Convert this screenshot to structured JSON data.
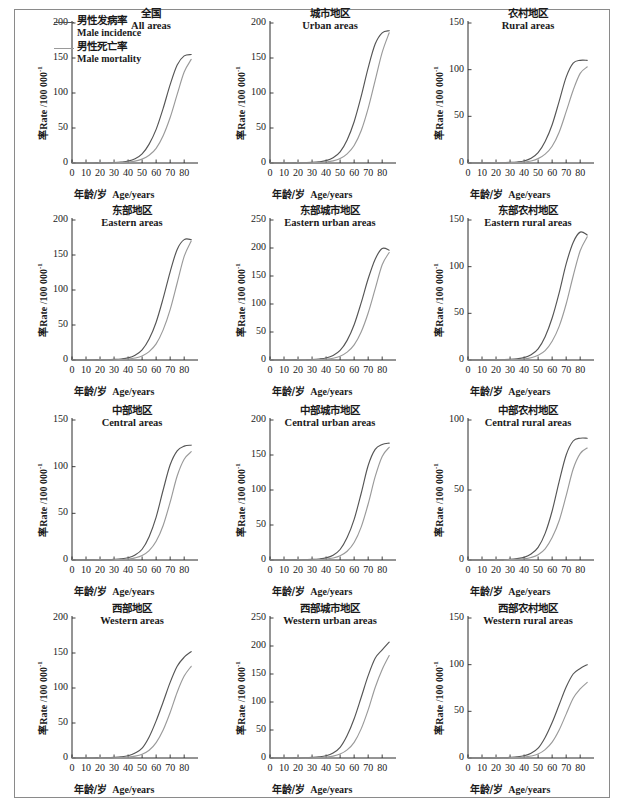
{
  "figure": {
    "axis_x_label_zh": "年龄/岁",
    "axis_x_label_en": "Age/years",
    "axis_y_label_zh": "率Rate /100 000",
    "axis_y_label_sup": "-1",
    "legend": [
      {
        "label_zh": "男性发病率",
        "label_en": "Male incidence",
        "color": "#555555"
      },
      {
        "label_zh": "男性死亡率",
        "label_en": "Male mortality",
        "color": "#9a9a9a"
      }
    ]
  },
  "chart_data": {
    "type": "line",
    "xlabel": "年龄/岁 Age/years",
    "ylabel": "率Rate /100 000-1",
    "xlim": [
      0,
      87
    ],
    "xticks": [
      0,
      10,
      20,
      30,
      40,
      50,
      60,
      70,
      80
    ],
    "x": [
      0,
      5,
      10,
      15,
      20,
      25,
      30,
      35,
      40,
      45,
      50,
      55,
      60,
      65,
      70,
      75,
      80,
      85
    ],
    "series_names": [
      "Male incidence",
      "Male mortality"
    ],
    "panels": [
      {
        "title_zh": "全国",
        "title_en": "All areas",
        "ylim": [
          0,
          200
        ],
        "yticks": [
          0,
          50,
          100,
          150,
          200
        ],
        "series": [
          {
            "name": "Male incidence",
            "color": "#555555",
            "values": [
              0,
              0,
              0,
              0,
              0.2,
              0.4,
              0.7,
              1.3,
              2.6,
              6.0,
              13.0,
              27.0,
              48.0,
              78.0,
              112.0,
              140.0,
              153.0,
              155.0
            ]
          },
          {
            "name": "Male mortality",
            "color": "#9a9a9a",
            "values": [
              0,
              0,
              0,
              0,
              0.1,
              0.2,
              0.3,
              0.6,
              1.2,
              2.6,
              5.5,
              11.0,
              21.0,
              39.0,
              65.0,
              98.0,
              130.0,
              148.0
            ]
          }
        ]
      },
      {
        "title_zh": "城市地区",
        "title_en": "Urban areas",
        "ylim": [
          0,
          200
        ],
        "yticks": [
          0,
          50,
          100,
          150,
          200
        ],
        "series": [
          {
            "name": "Male incidence",
            "color": "#555555",
            "values": [
              0,
              0,
              0,
              0,
              0.2,
              0.5,
              0.9,
              1.7,
              3.4,
              7.5,
              16.0,
              33.0,
              59.0,
              95.0,
              136.0,
              170.0,
              186.0,
              189.0
            ]
          },
          {
            "name": "Male mortality",
            "color": "#9a9a9a",
            "values": [
              0,
              0,
              0,
              0,
              0.1,
              0.2,
              0.4,
              0.7,
              1.4,
              3.0,
              6.3,
              13.0,
              25.0,
              46.0,
              78.0,
              118.0,
              158.0,
              186.0
            ]
          }
        ]
      },
      {
        "title_zh": "农村地区",
        "title_en": "Rural areas",
        "ylim": [
          0,
          150
        ],
        "yticks": [
          0,
          50,
          100,
          150
        ],
        "series": [
          {
            "name": "Male incidence",
            "color": "#555555",
            "values": [
              0,
              0,
              0,
              0,
              0.2,
              0.4,
              0.6,
              1.1,
              2.2,
              5.0,
              11.0,
              23.0,
              41.0,
              66.0,
              92.0,
              107.0,
              110.0,
              110.0
            ]
          },
          {
            "name": "Male mortality",
            "color": "#9a9a9a",
            "values": [
              0,
              0,
              0,
              0,
              0.1,
              0.2,
              0.3,
              0.5,
              1.0,
              2.2,
              4.7,
              9.5,
              18.0,
              33.0,
              55.0,
              78.0,
              96.0,
              103.0
            ]
          }
        ]
      },
      {
        "title_zh": "东部地区",
        "title_en": "Eastern areas",
        "ylim": [
          0,
          200
        ],
        "yticks": [
          0,
          50,
          100,
          150,
          200
        ],
        "series": [
          {
            "name": "Male incidence",
            "color": "#555555",
            "values": [
              0,
              0,
              0,
              0,
              0.2,
              0.4,
              0.8,
              1.5,
              3.0,
              6.8,
              14.5,
              30.0,
              54.0,
              88.0,
              126.0,
              158.0,
              172.0,
              172.0
            ]
          },
          {
            "name": "Male mortality",
            "color": "#9a9a9a",
            "values": [
              0,
              0,
              0,
              0,
              0.1,
              0.2,
              0.3,
              0.6,
              1.3,
              2.8,
              5.8,
              12.0,
              23.0,
              43.0,
              72.0,
              110.0,
              148.0,
              170.0
            ]
          }
        ]
      },
      {
        "title_zh": "东部城市地区",
        "title_en": "Eastern urban areas",
        "ylim": [
          0,
          250
        ],
        "yticks": [
          0,
          50,
          100,
          150,
          200,
          250
        ],
        "series": [
          {
            "name": "Male incidence",
            "color": "#555555",
            "values": [
              0,
              0,
              0,
              0,
              0.2,
              0.5,
              0.9,
              1.8,
              3.6,
              8.0,
              17.0,
              35.0,
              63.0,
              102.0,
              145.0,
              180.0,
              199.0,
              196.0
            ]
          },
          {
            "name": "Male mortality",
            "color": "#9a9a9a",
            "values": [
              0,
              0,
              0,
              0,
              0.1,
              0.2,
              0.4,
              0.8,
              1.5,
              3.2,
              6.8,
              14.0,
              27.0,
              50.0,
              84.0,
              127.0,
              170.0,
              192.0
            ]
          }
        ]
      },
      {
        "title_zh": "东部农村地区",
        "title_en": "Eastern rural areas",
        "ylim": [
          0,
          150
        ],
        "yticks": [
          0,
          50,
          100,
          150
        ],
        "series": [
          {
            "name": "Male incidence",
            "color": "#555555",
            "values": [
              0,
              0,
              0,
              0,
              0.2,
              0.4,
              0.7,
              1.3,
              2.5,
              5.6,
              12.0,
              25.0,
              45.0,
              72.0,
              103.0,
              126.0,
              137.0,
              134.0
            ]
          },
          {
            "name": "Male mortality",
            "color": "#9a9a9a",
            "values": [
              0,
              0,
              0,
              0,
              0.1,
              0.2,
              0.3,
              0.5,
              1.1,
              2.4,
              5.0,
              10.0,
              20.0,
              36.0,
              60.0,
              90.0,
              117.0,
              132.0
            ]
          }
        ]
      },
      {
        "title_zh": "中部地区",
        "title_en": "Central areas",
        "ylim": [
          0,
          150
        ],
        "yticks": [
          0,
          50,
          100,
          150
        ],
        "series": [
          {
            "name": "Male incidence",
            "color": "#555555",
            "values": [
              0,
              0,
              0,
              0,
              0.2,
              0.4,
              0.7,
              1.2,
              2.4,
              5.4,
              11.5,
              25.0,
              46.0,
              75.0,
              102.0,
              117.0,
              122.0,
              123.0
            ]
          },
          {
            "name": "Male mortality",
            "color": "#9a9a9a",
            "values": [
              0,
              0,
              0,
              0,
              0.1,
              0.2,
              0.3,
              0.5,
              1.0,
              2.3,
              4.8,
              10.0,
              20.0,
              37.0,
              62.0,
              90.0,
              108.0,
              116.0
            ]
          }
        ]
      },
      {
        "title_zh": "中部城市地区",
        "title_en": "Central urban areas",
        "ylim": [
          0,
          200
        ],
        "yticks": [
          0,
          50,
          100,
          150,
          200
        ],
        "series": [
          {
            "name": "Male incidence",
            "color": "#555555",
            "values": [
              0,
              0,
              0,
              0,
              0.2,
              0.5,
              0.8,
              1.5,
              3.0,
              6.8,
              15.0,
              32.0,
              58.0,
              95.0,
              135.0,
              158.0,
              165.0,
              167.0
            ]
          },
          {
            "name": "Male mortality",
            "color": "#9a9a9a",
            "values": [
              0,
              0,
              0,
              0,
              0.1,
              0.2,
              0.3,
              0.6,
              1.2,
              2.8,
              6.0,
              12.5,
              25.0,
              47.0,
              80.0,
              119.0,
              148.0,
              161.0
            ]
          }
        ]
      },
      {
        "title_zh": "中部农村地区",
        "title_en": "Central rural areas",
        "ylim": [
          0,
          100
        ],
        "yticks": [
          0,
          50,
          100
        ],
        "series": [
          {
            "name": "Male incidence",
            "color": "#555555",
            "values": [
              0,
              0,
              0,
              0,
              0.2,
              0.3,
              0.5,
              1.0,
              1.9,
              4.3,
              9.0,
              19.0,
              35.0,
              56.0,
              75.0,
              85.0,
              87.0,
              87.0
            ]
          },
          {
            "name": "Male mortality",
            "color": "#9a9a9a",
            "values": [
              0,
              0,
              0,
              0,
              0.1,
              0.2,
              0.3,
              0.4,
              0.8,
              1.8,
              3.8,
              8.0,
              16.0,
              28.0,
              46.0,
              65.0,
              76.0,
              80.0
            ]
          }
        ]
      },
      {
        "title_zh": "西部地区",
        "title_en": "Western areas",
        "ylim": [
          0,
          200
        ],
        "yticks": [
          0,
          50,
          100,
          150,
          200
        ],
        "series": [
          {
            "name": "Male incidence",
            "color": "#555555",
            "values": [
              0,
              0,
              0,
              0,
              0.3,
              0.5,
              0.9,
              1.6,
              3.2,
              7.0,
              14.0,
              30.0,
              53.0,
              80.0,
              108.0,
              131.0,
              144.0,
              152.0
            ]
          },
          {
            "name": "Male mortality",
            "color": "#9a9a9a",
            "values": [
              0,
              0,
              0,
              0,
              0.1,
              0.2,
              0.3,
              0.6,
              1.2,
              2.6,
              5.4,
              11.0,
              22.0,
              40.0,
              65.0,
              94.0,
              117.0,
              131.0
            ]
          }
        ]
      },
      {
        "title_zh": "西部城市地区",
        "title_en": "Western urban areas",
        "ylim": [
          0,
          250
        ],
        "yticks": [
          0,
          50,
          100,
          150,
          200,
          250
        ],
        "series": [
          {
            "name": "Male incidence",
            "color": "#555555",
            "values": [
              0,
              0,
              0,
              0,
              0.3,
              0.6,
              1.1,
              2.0,
              4.0,
              9.0,
              19.0,
              40.0,
              70.0,
              108.0,
              147.0,
              178.0,
              193.0,
              207.0
            ]
          },
          {
            "name": "Male mortality",
            "color": "#9a9a9a",
            "values": [
              0,
              0,
              0,
              0,
              0.1,
              0.2,
              0.4,
              0.8,
              1.5,
              3.3,
              7.0,
              14.5,
              28.0,
              52.0,
              86.0,
              126.0,
              158.0,
              183.0
            ]
          }
        ]
      },
      {
        "title_zh": "西部农村地区",
        "title_en": "Western rural areas",
        "ylim": [
          0,
          150
        ],
        "yticks": [
          0,
          50,
          100,
          150
        ],
        "series": [
          {
            "name": "Male incidence",
            "color": "#555555",
            "values": [
              0,
              0,
              0,
              0,
              0.2,
              0.4,
              0.7,
              1.2,
              2.4,
              5.2,
              10.5,
              22.0,
              38.0,
              57.0,
              76.0,
              90.0,
              96.0,
              100.0
            ]
          },
          {
            "name": "Male mortality",
            "color": "#9a9a9a",
            "values": [
              0,
              0,
              0,
              0,
              0.1,
              0.2,
              0.3,
              0.5,
              1.0,
              2.1,
              4.3,
              9.0,
              17.0,
              30.0,
              47.0,
              64.0,
              74.0,
              81.0
            ]
          }
        ]
      }
    ]
  }
}
